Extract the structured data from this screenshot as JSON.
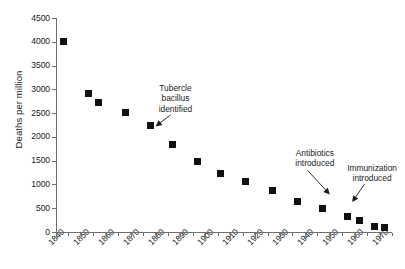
{
  "chart_data": {
    "type": "scatter",
    "title": "",
    "xlabel": "",
    "ylabel": "Deaths per million",
    "xlim": [
      1840,
      1975
    ],
    "ylim": [
      0,
      4500
    ],
    "grid": false,
    "legend": "none",
    "marker": "filled-square",
    "marker_color": "#111111",
    "x_tick_labels": [
      "1840",
      "1850",
      "1860",
      "1870",
      "1880",
      "1890",
      "1900",
      "1910",
      "1920",
      "1930",
      "1940",
      "1950",
      "1960",
      "1970"
    ],
    "x_tick_values": [
      1840,
      1850,
      1860,
      1870,
      1880,
      1890,
      1900,
      1910,
      1920,
      1930,
      1940,
      1950,
      1960,
      1970
    ],
    "x_minor_tick_step": 5,
    "y_tick_labels": [
      "0",
      "500",
      "1000",
      "1500",
      "2000",
      "2500",
      "3000",
      "3500",
      "4000",
      "4500"
    ],
    "y_tick_values": [
      0,
      500,
      1000,
      1500,
      2000,
      2500,
      3000,
      3500,
      4000,
      4500
    ],
    "points": [
      {
        "x": 1843,
        "y": 4000
      },
      {
        "x": 1853,
        "y": 2910
      },
      {
        "x": 1857,
        "y": 2730
      },
      {
        "x": 1868,
        "y": 2510
      },
      {
        "x": 1878,
        "y": 2230
      },
      {
        "x": 1887,
        "y": 1840
      },
      {
        "x": 1897,
        "y": 1490
      },
      {
        "x": 1906,
        "y": 1230
      },
      {
        "x": 1916,
        "y": 1065
      },
      {
        "x": 1927,
        "y": 880
      },
      {
        "x": 1937,
        "y": 640
      },
      {
        "x": 1947,
        "y": 495
      },
      {
        "x": 1957,
        "y": 330
      },
      {
        "x": 1962,
        "y": 250
      },
      {
        "x": 1968,
        "y": 110
      },
      {
        "x": 1972,
        "y": 105
      }
    ],
    "annotations": [
      {
        "id": "tubercle",
        "text": "Tubercle\nbacillus\nidentified",
        "text_x": 1888,
        "text_y": 2960,
        "arrow_from_x": 1886,
        "arrow_from_y": 2460,
        "arrow_to_x": 1880,
        "arrow_to_y": 2220
      },
      {
        "id": "antibiotics",
        "text": "Antibiotics\nintroduced",
        "text_x": 1944,
        "text_y": 1600,
        "arrow_from_x": 1941,
        "arrow_from_y": 1300,
        "arrow_to_x": 1950,
        "arrow_to_y": 790
      },
      {
        "id": "immunization",
        "text": "Immunization\nintroduced",
        "text_x": 1967,
        "text_y": 1290,
        "arrow_from_x": 1964,
        "arrow_from_y": 1010,
        "arrow_to_x": 1959,
        "arrow_to_y": 630
      }
    ]
  }
}
